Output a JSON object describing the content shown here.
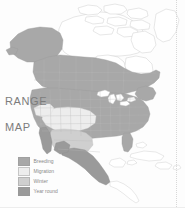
{
  "caption": {
    "line1": "RANGE",
    "line2": "MAP"
  },
  "legend": {
    "items": [
      {
        "label": "Breeding",
        "color": "#a8a8a8"
      },
      {
        "label": "Migration",
        "color": "#ededed"
      },
      {
        "label": "Winter",
        "color": "#cfcfcf"
      },
      {
        "label": "Year round",
        "color": "#9a9a9a"
      }
    ]
  },
  "map": {
    "region": "North America",
    "colors": {
      "land_fill": "#ffffff",
      "land_stroke": "#c9c9c9",
      "border_stroke": "#bdbdbd",
      "breeding": "#a8a8a8",
      "migration": "#ededed",
      "winter": "#cfcfcf",
      "year_round": "#9a9a9a",
      "water": "#ffffff",
      "background": "#fdfdfd"
    },
    "shaded_areas": [
      "Alaska",
      "Western Canada",
      "Central Canada",
      "Eastern Canada",
      "Contiguous United States",
      "Northern Mexico",
      "Central Mexico"
    ],
    "unshaded_areas": [
      "Arctic Canada",
      "Canadian Arctic Archipelago",
      "Greenland edge",
      "Cuba",
      "Hispaniola",
      "Bahamas",
      "Central America south",
      "Caribbean islands"
    ]
  },
  "decor": {
    "right_rule": "dotted-vertical-rule",
    "bottom_rule": "horizontal-divider"
  }
}
